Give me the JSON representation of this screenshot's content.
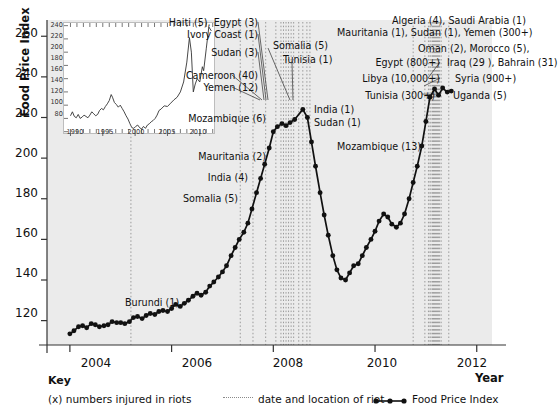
{
  "chart_data": {
    "type": "line",
    "title": "",
    "xlabel": "Year",
    "ylabel": "Food Price Index",
    "xlim": [
      2003.55,
      2012.3
    ],
    "ylim": [
      108,
      268
    ],
    "yticks": [
      120,
      140,
      160,
      180,
      200,
      220,
      240,
      260
    ],
    "xticks": [
      2004,
      2006,
      2008,
      2010,
      2012
    ],
    "grid": false,
    "legend_position": "bottom",
    "series": [
      {
        "name": "Food Price Index",
        "x": [
          2004.0,
          2004.08,
          2004.17,
          2004.25,
          2004.33,
          2004.42,
          2004.5,
          2004.58,
          2004.67,
          2004.75,
          2004.83,
          2004.92,
          2005.0,
          2005.08,
          2005.17,
          2005.25,
          2005.33,
          2005.42,
          2005.5,
          2005.58,
          2005.67,
          2005.75,
          2005.83,
          2005.92,
          2006.0,
          2006.08,
          2006.17,
          2006.25,
          2006.33,
          2006.42,
          2006.5,
          2006.58,
          2006.67,
          2006.75,
          2006.83,
          2006.92,
          2007.0,
          2007.08,
          2007.17,
          2007.25,
          2007.33,
          2007.42,
          2007.5,
          2007.58,
          2007.67,
          2007.75,
          2007.83,
          2007.92,
          2008.0,
          2008.08,
          2008.17,
          2008.25,
          2008.33,
          2008.42,
          2008.58,
          2008.67,
          2008.75,
          2008.83,
          2008.92,
          2009.0,
          2009.08,
          2009.17,
          2009.25,
          2009.33,
          2009.42,
          2009.5,
          2009.58,
          2009.67,
          2009.75,
          2009.83,
          2009.92,
          2010.0,
          2010.08,
          2010.17,
          2010.25,
          2010.33,
          2010.42,
          2010.5,
          2010.58,
          2010.67,
          2010.75,
          2010.83,
          2010.92,
          2011.0,
          2011.08,
          2011.17,
          2011.25,
          2011.33,
          2011.42,
          2011.5
        ],
        "y": [
          113.5,
          115.0,
          117.0,
          117.5,
          116.5,
          118.5,
          118.0,
          117.0,
          117.5,
          118.0,
          119.5,
          119.0,
          119.0,
          118.5,
          119.5,
          121.5,
          122.0,
          121.0,
          122.5,
          123.5,
          123.0,
          124.5,
          125.0,
          124.5,
          126.0,
          128.0,
          127.0,
          128.5,
          130.0,
          132.0,
          133.5,
          132.5,
          134.0,
          137.0,
          139.0,
          141.5,
          144.0,
          147.0,
          152.0,
          156.0,
          160.0,
          163.5,
          168.0,
          175.0,
          183.0,
          190.0,
          197.0,
          205.0,
          213.0,
          215.5,
          217.0,
          216.0,
          217.5,
          219.0,
          224.0,
          220.0,
          208.0,
          196.0,
          183.0,
          172.0,
          162.0,
          152.0,
          145.0,
          141.0,
          140.0,
          143.5,
          147.0,
          148.0,
          152.0,
          156.0,
          160.0,
          164.0,
          169.0,
          172.5,
          171.0,
          167.5,
          166.0,
          168.0,
          172.5,
          180.0,
          188.0,
          196.0,
          206.0,
          218.0,
          230.0,
          234.0,
          231.0,
          234.5,
          232.5,
          233.0
        ]
      }
    ],
    "inset": {
      "type": "line",
      "xlim": [
        1989.0,
        2012.2
      ],
      "ylim": [
        78,
        244
      ],
      "yticks": [
        80,
        100,
        120,
        140,
        160,
        180,
        200,
        220,
        240
      ],
      "xticks": [
        1990,
        1995,
        2000,
        2005,
        2010
      ],
      "x": [
        1990.0,
        1990.3,
        1990.6,
        1990.9,
        1991.2,
        1991.5,
        1991.8,
        1992.1,
        1992.4,
        1992.7,
        1993.0,
        1993.3,
        1993.6,
        1993.9,
        1994.2,
        1994.5,
        1994.8,
        1995.1,
        1995.4,
        1995.7,
        1996.0,
        1996.3,
        1996.5,
        1996.8,
        1997.1,
        1997.4,
        1997.7,
        1998.0,
        1998.3,
        1998.6,
        1998.9,
        1999.2,
        1999.5,
        1999.8,
        2000.1,
        2000.4,
        2000.7,
        2001.0,
        2001.3,
        2001.6,
        2001.9,
        2002.2,
        2002.5,
        2002.8,
        2003.1,
        2003.4,
        2003.7,
        2004.0,
        2004.5,
        2005.0,
        2005.5,
        2006.0,
        2006.5,
        2007.0,
        2007.5,
        2008.0,
        2008.4,
        2008.7,
        2009.0,
        2009.3,
        2009.6,
        2010.0,
        2010.4,
        2010.6,
        2011.0,
        2011.4,
        2011.8
      ],
      "y": [
        104,
        110,
        103,
        101,
        106,
        100,
        102,
        105,
        103,
        101,
        105,
        110,
        107,
        104,
        106,
        112,
        115,
        113,
        118,
        122,
        127,
        136,
        132,
        124,
        121,
        117,
        120,
        115,
        110,
        104,
        99,
        92,
        86,
        85,
        88,
        90,
        86,
        84,
        88,
        85,
        90,
        92,
        95,
        97,
        100,
        105,
        112,
        114,
        119,
        118,
        123,
        128,
        132,
        140,
        155,
        185,
        222,
        200,
        140,
        152,
        160,
        155,
        178,
        172,
        205,
        238,
        232
      ]
    },
    "riot_events": [
      {
        "label": "Burundi (1)",
        "x": 2005.2
      },
      {
        "label": "Somalia (5)",
        "x": 2007.35
      },
      {
        "label": "India (4)",
        "x": 2007.6
      },
      {
        "label": "Mauritania (2)",
        "x": 2007.85
      },
      {
        "label": "Mozambique (6)",
        "x": 2008.05
      },
      {
        "label": "Yemen (12)",
        "x": 2008.15
      },
      {
        "label": "Cameroon (40)",
        "x": 2008.2
      },
      {
        "label": "Sudan (3)",
        "x": 2008.25
      },
      {
        "label": "Ivory Coast (1)",
        "x": 2008.3
      },
      {
        "label": "Egypt (3)",
        "x": 2008.35
      },
      {
        "label": "Haiti (5)",
        "x": 2008.4
      },
      {
        "label": "Somalia (5)",
        "x": 2008.5
      },
      {
        "label": "Tunisia (1)",
        "x": 2008.58
      },
      {
        "label": "India (1)",
        "x": 2008.66
      },
      {
        "label": "Sudan (1)",
        "x": 2008.72
      },
      {
        "label": "Mozambique (13)",
        "x": 2010.75
      },
      {
        "label": "Tunisia (300+)",
        "x": 2010.98
      },
      {
        "label": "Libya (10,000+)",
        "x": 2011.05
      },
      {
        "label": "Egypt (800+)",
        "x": 2011.08
      },
      {
        "label": "Algeria (4)",
        "x": 2011.1
      },
      {
        "label": "Saudi Arabia (1)",
        "x": 2011.13
      },
      {
        "label": "Mauritania (1)",
        "x": 2011.15
      },
      {
        "label": "Sudan (1)",
        "x": 2011.17
      },
      {
        "label": "Yemen (300+)",
        "x": 2011.19
      },
      {
        "label": "Oman (2)",
        "x": 2011.21
      },
      {
        "label": "Morocco (5)",
        "x": 2011.23
      },
      {
        "label": "Iraq (29 )",
        "x": 2011.25
      },
      {
        "label": "Bahrain (31)",
        "x": 2011.27
      },
      {
        "label": "Syria (900+)",
        "x": 2011.3
      },
      {
        "label": "Uganda (5)",
        "x": 2011.45
      }
    ]
  },
  "axes": {
    "y_title": "Food Price Index",
    "x_title": "Year",
    "y_ticks": [
      "260",
      "240",
      "220",
      "200",
      "180",
      "160",
      "140",
      "120"
    ],
    "x_ticks": [
      "2004",
      "2006",
      "2008",
      "2010",
      "2012"
    ]
  },
  "inset_axes": {
    "y_ticks": [
      "240",
      "220",
      "200",
      "180",
      "160",
      "140",
      "120",
      "100",
      "80"
    ],
    "x_ticks": [
      "1990",
      "1995",
      "2000",
      "2005",
      "2010"
    ]
  },
  "annotations": {
    "left_cluster": [
      "Haiti (5), Egypt (3)",
      "Ivory Coast (1)",
      "Sudan (3)",
      "Cameroon (40)",
      "Yemen (12)",
      "Mozambique (6)",
      "Mauritania (2)",
      "India (4)",
      "Somalia (5)"
    ],
    "mid_cluster": [
      "Somalia (5)",
      "Tunisia (1)",
      "India (1)",
      "Sudan (1)"
    ],
    "early": "Burundi (1)",
    "mozambique_2010": "Mozambique (13)",
    "right_cluster": [
      "Algeria (4), Saudi Arabia (1)",
      "Mauritania (1), Sudan (1), Yemen (300+)",
      "Oman (2), Morocco (5),",
      "Egypt (800+)",
      "Iraq (29 ), Bahrain (31)",
      "Libya (10,000+)",
      "Syria (900+)",
      "Tunisia (300+)",
      "Uganda (5)"
    ]
  },
  "key": {
    "title": "Key",
    "item_numbers": "(x) numbers injured in riots",
    "item_dotted": "date and location of riot",
    "item_line": "Food Price Index"
  }
}
